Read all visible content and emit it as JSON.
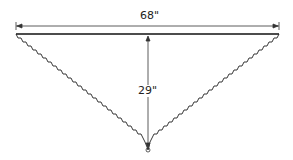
{
  "diagram": {
    "shape": "triangular shawl with scalloped edges",
    "width_label": "68\"",
    "depth_label": "29\"",
    "line_color": "#222222"
  }
}
